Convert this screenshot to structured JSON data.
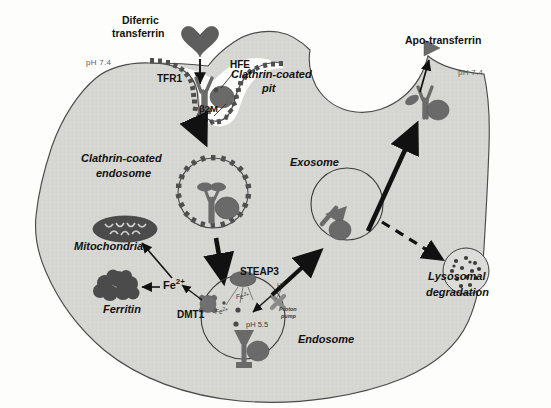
{
  "figure": {
    "type": "cell-biology-pathway-diagram"
  },
  "colors": {
    "cytoplasm_fill": "#d6d6d2",
    "extracellular_fill": "#fdfdfb",
    "membrane_stroke": "#4a4a4a",
    "protein_dark": "#5a5a5a",
    "protein_mid": "#6e6e6e",
    "arrow": "#111111",
    "text": "#111111",
    "text_muted": "#5d5d5d"
  },
  "labels": {
    "diferric_transferrin": "Diferric\ntransferrin",
    "diferric_transferrin_l1": "Diferric",
    "diferric_transferrin_l2": "transferrin",
    "hfe": "HFE",
    "tfr1": "TFR1",
    "b2m": "β2M",
    "clathrin_coated_pit_l1": "Clathrin-coated",
    "clathrin_coated_pit_l2": "pit",
    "clathrin_coated_endosome_l1": "Clathrin-coated",
    "clathrin_coated_endosome_l2": "endosome",
    "apo_transferrin": "Apo-transferrin",
    "ph_outer_left": "pH 7.4",
    "ph_outer_right": "pH 7.4",
    "ph_endosome": "pH 5.5",
    "exosome": "Exosome",
    "endosome": "Endosome",
    "lysosomal_degradation_l1": "Lysosomal",
    "lysosomal_degradation_l2": "degradation",
    "mitochondria": "Mitochondria",
    "ferritin": "Ferritin",
    "steap3": "STEAP3",
    "dmt1": "DMT1",
    "fe2_cytosol": "Fe2+",
    "fe2_cytosol_base": "Fe",
    "fe2_cytosol_sup": "2+",
    "fe3_endosome_base": "Fe",
    "fe3_endosome_sup": "3+",
    "fe2_endosome_base": "Fe",
    "fe2_endosome_sup": "2+",
    "proton": "H+",
    "proton_base": "H",
    "proton_sup": "+",
    "proton_pump_l1": "Proton",
    "proton_pump_l2": "pump"
  },
  "pathway_steps": [
    {
      "id": "step-1",
      "from": "Diferric transferrin",
      "to": "TFR1 receptor at clathrin-coated pit",
      "style": "solid"
    },
    {
      "id": "step-2",
      "from": "Clathrin-coated pit",
      "to": "Clathrin-coated endosome",
      "style": "solid-thick"
    },
    {
      "id": "step-3",
      "from": "Clathrin-coated endosome",
      "to": "Endosome",
      "style": "solid-thick"
    },
    {
      "id": "step-4",
      "from": "Endosome",
      "to": "Exosome",
      "style": "solid-thick"
    },
    {
      "id": "step-5",
      "from": "Exosome",
      "to": "Cell surface / Apo-transferrin release",
      "style": "solid-thick"
    },
    {
      "id": "step-6",
      "from": "TFR1 at surface",
      "to": "Apo-transferrin",
      "style": "solid-thin"
    },
    {
      "id": "step-7",
      "from": "Exosome",
      "to": "Lysosomal degradation",
      "style": "dashed"
    },
    {
      "id": "step-8",
      "from": "DMT1 export",
      "to": "Fe2+ cytosolic pool",
      "style": "solid-thin"
    },
    {
      "id": "step-9",
      "from": "Fe2+ cytosolic pool",
      "to": "Ferritin",
      "style": "solid-thin"
    },
    {
      "id": "step-10",
      "from": "Fe2+ cytosolic pool",
      "to": "Mitochondria",
      "style": "solid-thin"
    },
    {
      "id": "step-11",
      "from": "STEAP3 Fe3+ reduction",
      "to": "Fe2+ inside endosome",
      "style": "thin"
    },
    {
      "id": "step-12",
      "from": "H+ proton pump",
      "to": "Endosome lumen acidification (pH 5.5)",
      "style": "solid-thin"
    }
  ],
  "organelles": [
    {
      "name": "clathrin-coated-pit",
      "label": "Clathrin-coated pit"
    },
    {
      "name": "clathrin-coated-endosome",
      "label": "Clathrin-coated endosome"
    },
    {
      "name": "endosome",
      "label": "Endosome"
    },
    {
      "name": "exosome",
      "label": "Exosome"
    },
    {
      "name": "lysosome",
      "label": "Lysosomal degradation"
    },
    {
      "name": "mitochondria",
      "label": "Mitochondria"
    },
    {
      "name": "ferritin",
      "label": "Ferritin"
    }
  ],
  "proteins": [
    {
      "name": "tfr1",
      "label": "TFR1"
    },
    {
      "name": "hfe",
      "label": "HFE"
    },
    {
      "name": "b2m",
      "label": "β2M"
    },
    {
      "name": "steap3",
      "label": "STEAP3"
    },
    {
      "name": "dmt1",
      "label": "DMT1"
    },
    {
      "name": "proton-pump",
      "label": "Proton pump"
    }
  ]
}
